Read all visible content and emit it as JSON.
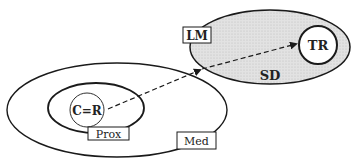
{
  "diagram": {
    "regions": [
      {
        "id": "med",
        "label": "Med"
      },
      {
        "id": "prox",
        "label": "Prox"
      },
      {
        "id": "sd",
        "label": "SD"
      }
    ],
    "nodes": [
      {
        "id": "cr",
        "label": "C=R"
      },
      {
        "id": "tr",
        "label": "TR"
      },
      {
        "id": "lm",
        "label": "LM"
      }
    ],
    "edges": [
      {
        "from": "C=R",
        "to": "TR",
        "style": "dashed",
        "arrowheads": [
          "mid",
          "end"
        ]
      }
    ],
    "colors": {
      "stroke": "#1a1a1a",
      "sd_fill": "#dcdcdc",
      "background": "#ffffff"
    }
  }
}
